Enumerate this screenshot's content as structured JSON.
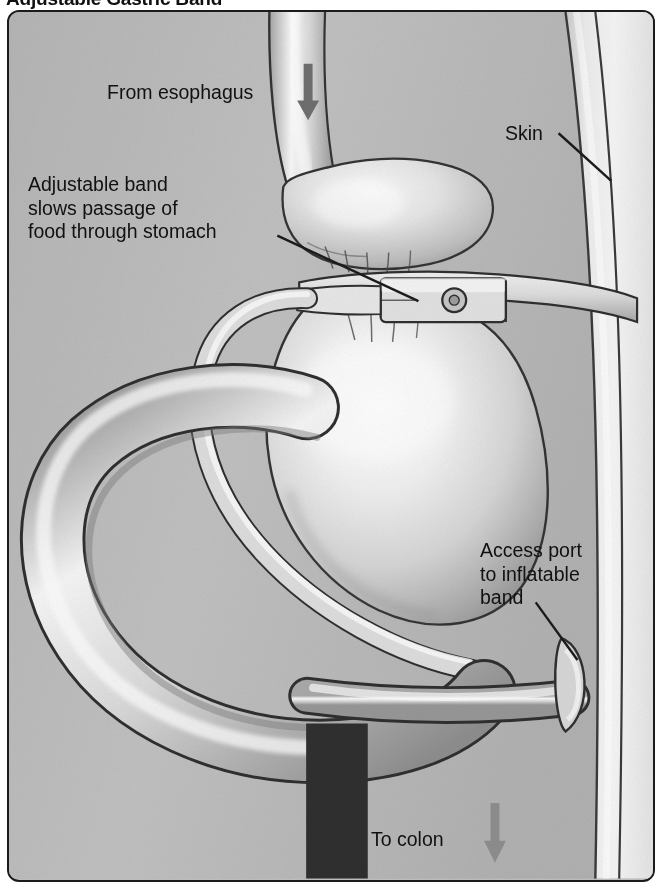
{
  "figure": {
    "title": "Adjustable Gastric Band",
    "type": "medical-illustration",
    "style": "grayscale airbrush medical diagram",
    "frame": {
      "border_color": "#1b1b1b",
      "background_color": "#bcbcbc",
      "corner_radius_px": 12
    }
  },
  "labels": {
    "esophagus": "From esophagus",
    "skin": "Skin",
    "band": "Adjustable band\nslows passage of\nfood through stomach",
    "port": "Access port\nto inflatable\nband",
    "colon": "To colon"
  },
  "arrows": [
    {
      "name": "esophagus-flow-arrow",
      "direction": "down",
      "color": "#6e6e6e"
    },
    {
      "name": "colon-flow-arrow",
      "direction": "down",
      "color": "#8a8a8a"
    }
  ],
  "leader_lines": [
    {
      "name": "skin-leader",
      "from": "skin-label",
      "to": "abdominal-wall"
    },
    {
      "name": "band-leader",
      "from": "band-label",
      "to": "gastric-band-buckle"
    },
    {
      "name": "port-leader",
      "from": "port-label",
      "to": "access-port"
    }
  ],
  "anatomy": [
    {
      "name": "esophagus",
      "description": "vertical tube entering from top"
    },
    {
      "name": "gastric-pouch",
      "description": "small upper stomach pouch above band"
    },
    {
      "name": "gastric-band",
      "description": "silicone band with buckle around upper stomach"
    },
    {
      "name": "band-tubing",
      "description": "tube from band curving left and down to port"
    },
    {
      "name": "stomach-body",
      "description": "large lower stomach below the band"
    },
    {
      "name": "small-intestine-loop",
      "description": "large bowel loop at left"
    },
    {
      "name": "access-port",
      "description": "injection port at abdominal wall"
    },
    {
      "name": "skin-abdominal-wall",
      "description": "layered body wall at right edge"
    },
    {
      "name": "descending-bowel",
      "description": "vertical bowel exiting at bottom"
    }
  ],
  "colors": {
    "background": "#bcbcbc",
    "organ_light": "#f2f2f2",
    "organ_mid": "#cfcfcf",
    "organ_shadow": "#8e8e8e",
    "outline": "#2a2a2a",
    "skin_light": "#ededed",
    "text": "#111111",
    "arrow": "#6e6e6e"
  }
}
